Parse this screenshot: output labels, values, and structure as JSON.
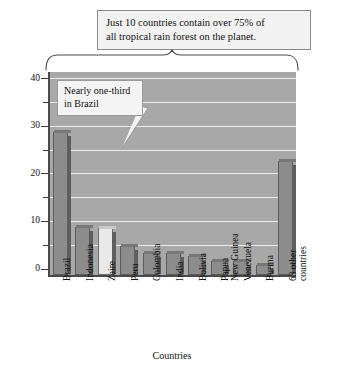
{
  "chart_data": {
    "type": "bar",
    "title": "Just 10 countries contain over 75% of all tropical rain forest on the planet.",
    "title_line1": "Just 10 countries contain over 75% of",
    "title_line2": "all tropical rain forest on the planet.",
    "xlabel": "Countries",
    "ylabel": "Percent of total rain forest",
    "ylim": [
      0,
      43
    ],
    "yticks": [
      0,
      10,
      20,
      30,
      40
    ],
    "ytick_labels": [
      "0",
      "10",
      "20",
      "30",
      "40"
    ],
    "yminor_ticks": [
      5,
      15,
      25,
      35
    ],
    "grid": true,
    "legend": "none",
    "categories": [
      "Brazil",
      "Indonesia",
      "Zaire",
      "Peru",
      "Colombia",
      "India",
      "Bolivia",
      "Papua New Guinea",
      "Venezuela",
      "Burma",
      "63 other countries"
    ],
    "category_lines": [
      [
        "Brazil"
      ],
      [
        "Indonesia"
      ],
      [
        "Zaire"
      ],
      [
        "Peru"
      ],
      [
        "Colombia"
      ],
      [
        "India"
      ],
      [
        "Bolivia"
      ],
      [
        "Papua",
        "New Guinea"
      ],
      [
        "Venezuela"
      ],
      [
        "Burma"
      ],
      [
        "63 other",
        "countries"
      ]
    ],
    "values": [
      30,
      10,
      9.8,
      6,
      4.6,
      4.6,
      4,
      3,
      3,
      2,
      24
    ],
    "bar_colors": [
      "#8c8c8c",
      "#8c8c8c",
      "#e9e9e9",
      "#8c8c8c",
      "#8c8c8c",
      "#8c8c8c",
      "#8c8c8c",
      "#8c8c8c",
      "#8c8c8c",
      "#8c8c8c",
      "#8c8c8c"
    ],
    "annotations": [
      {
        "text": "Nearly one-third in Brazil",
        "line1": "Nearly one-third",
        "line2": "in Brazil",
        "points_to": "Brazil"
      },
      {
        "text": "Brace spanning the first 10 countries",
        "spans": [
          "Brazil",
          "Burma"
        ]
      }
    ],
    "plot_background": "#a8a8a8",
    "gridline_color": "#ededed",
    "axis_color": "#4a4a4a"
  }
}
